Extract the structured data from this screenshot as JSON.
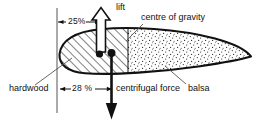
{
  "diagram": {
    "labels": {
      "lift": "lift",
      "centre_of_gravity": "centre of gravity",
      "chord_percent_top": "25%",
      "chord_percent_bottom": "28 %",
      "hardwood": "hardwood",
      "centrifugal_force": "centrifugal force",
      "balsa": "balsa"
    },
    "icons": {
      "lift_arrow": "up-arrow-outline-icon",
      "centrifugal_arrow": "down-arrow-solid-icon",
      "dimension_arrow_left": "arrow-left-icon",
      "dimension_arrow_right": "arrow-right-icon",
      "cg_marker": "dot-marker-icon"
    },
    "materials": [
      {
        "name": "hardwood",
        "fill": "diagonal-hatch"
      },
      {
        "name": "balsa",
        "fill": "stipple-dots"
      }
    ],
    "colors": {
      "ink": "#111111",
      "paper": "#ffffff",
      "hatch": "#1a1a1a",
      "stipple": "#2a2a2a"
    },
    "measurements": [
      {
        "label": "25%",
        "position": "top",
        "meaning": "chord station of lift / centre of gravity"
      },
      {
        "label": "28 %",
        "position": "bottom",
        "meaning": "chord station of centrifugal force line"
      }
    ]
  }
}
